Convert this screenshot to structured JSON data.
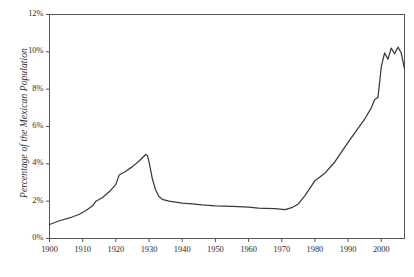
{
  "chart_data": {
    "type": "line",
    "title": "",
    "subtitle": "",
    "xlabel": "",
    "ylabel": "Percentage of the Mexican Population",
    "xlim": [
      1900,
      2007
    ],
    "ylim": [
      0,
      12
    ],
    "grid": false,
    "legend": null,
    "line_color": "#3a3a3a",
    "axis_color": "#555555",
    "background": "#ffffff",
    "x_ticks": [
      1900,
      1910,
      1920,
      1930,
      1940,
      1950,
      1960,
      1970,
      1980,
      1990,
      2000
    ],
    "x_tick_labels": [
      "1900",
      "1910",
      "1920",
      "1930",
      "1940",
      "1950",
      "1960",
      "1970",
      "1980",
      "1990",
      "2000"
    ],
    "y_ticks": [
      0,
      2,
      4,
      6,
      8,
      10,
      12
    ],
    "y_tick_labels": [
      "0%",
      "2%",
      "4%",
      "6%",
      "8%",
      "10%",
      "12%"
    ],
    "series": [
      {
        "name": "Percentage of the Mexican Population",
        "x": [
          1900,
          1903,
          1906,
          1909,
          1911,
          1913,
          1914,
          1916,
          1918,
          1920,
          1921,
          1923,
          1925,
          1927,
          1929,
          1929.5,
          1930,
          1931,
          1932,
          1933,
          1934,
          1936,
          1938,
          1940,
          1943,
          1946,
          1950,
          1955,
          1960,
          1963,
          1965,
          1968,
          1971,
          1973,
          1975,
          1977,
          1980,
          1983,
          1986,
          1989,
          1991,
          1993,
          1995,
          1997,
          1998,
          1998.5,
          1999,
          2000,
          2001,
          2002,
          2003,
          2004,
          2005,
          2006,
          2007
        ],
        "y": [
          0.75,
          0.95,
          1.1,
          1.3,
          1.5,
          1.75,
          2.0,
          2.2,
          2.5,
          2.9,
          3.4,
          3.6,
          3.85,
          4.15,
          4.5,
          4.45,
          4.1,
          3.2,
          2.6,
          2.25,
          2.1,
          2.0,
          1.95,
          1.9,
          1.85,
          1.8,
          1.75,
          1.72,
          1.68,
          1.63,
          1.62,
          1.6,
          1.55,
          1.65,
          1.85,
          2.3,
          3.1,
          3.5,
          4.1,
          4.9,
          5.4,
          5.9,
          6.4,
          7.0,
          7.45,
          7.5,
          7.55,
          9.2,
          9.95,
          9.6,
          10.2,
          9.9,
          10.25,
          9.95,
          9.1
        ]
      }
    ]
  }
}
